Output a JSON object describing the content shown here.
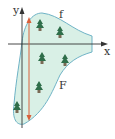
{
  "diagram": {
    "axes": {
      "x_label": "x",
      "y_label": "y"
    },
    "curves": {
      "upper_label": "f",
      "lower_label": "F"
    },
    "colors": {
      "region_fill": "#d9f0e6",
      "region_stroke": "#6fb3c6",
      "axis": "#333333",
      "arrow": "#d9603b",
      "tree": "#2f6e4a"
    },
    "trees": [
      {
        "x": 40,
        "y": 25
      },
      {
        "x": 60,
        "y": 32
      },
      {
        "x": 42,
        "y": 58
      },
      {
        "x": 65,
        "y": 60
      },
      {
        "x": 39,
        "y": 87
      },
      {
        "x": 17,
        "y": 107
      }
    ]
  }
}
